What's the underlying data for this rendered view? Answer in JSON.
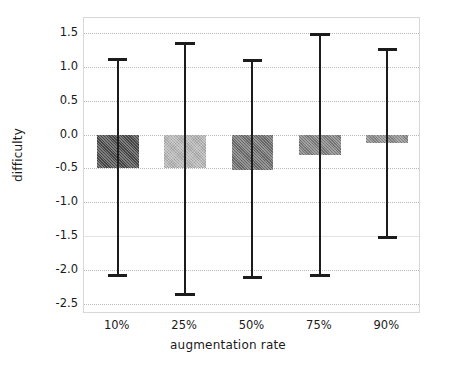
{
  "chart_data": {
    "type": "bar",
    "title": "",
    "xlabel": "augmentation rate",
    "ylabel": "difficulty",
    "categories": [
      "10%",
      "25%",
      "50%",
      "75%",
      "90%"
    ],
    "values": [
      -0.5,
      -0.5,
      -0.53,
      -0.31,
      -0.12
    ],
    "error_upper": [
      1.13,
      1.37,
      1.12,
      1.5,
      1.27
    ],
    "error_lower": [
      -2.1,
      -2.39,
      -2.14,
      -2.11,
      -1.55
    ],
    "ylim": [
      -2.65,
      1.72
    ],
    "yticks": [
      "1.5",
      "1.0",
      "0.5",
      "0.0",
      "-0.5",
      "-1.0",
      "-1.5",
      "-2.0",
      "-2.5"
    ],
    "ytick_values": [
      1.5,
      1.0,
      0.5,
      0.0,
      -0.5,
      -1.0,
      -1.5,
      -2.0,
      -2.5
    ],
    "grid": true,
    "legend": "none",
    "bar_colors": [
      "#4a4a4a",
      "#b5b5b5",
      "#6e6e6e",
      "#7e7e7e",
      "#8a8a8a"
    ],
    "errorbar_color": "#1c1c1c",
    "grid_color": "#b9b9b9",
    "axes_color": "#d8d8d8"
  }
}
